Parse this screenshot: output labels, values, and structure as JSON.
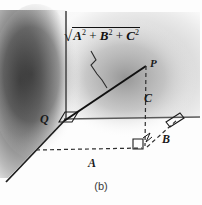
{
  "figure": {
    "caption": "(b)",
    "formula": {
      "radical": "√",
      "term1": "A",
      "exp1": "2",
      "plus1": "+",
      "term2": "B",
      "exp2": "2",
      "plus2": "+",
      "term3": "C",
      "exp3": "2",
      "full_text": "√(A² + B² + C²)"
    },
    "labels": {
      "P": "P",
      "Q": "Q",
      "A": "A",
      "B": "B",
      "C": "C"
    },
    "colors": {
      "ink": "#1a1a1a",
      "axis": "#555555",
      "dashed": "#3a3a3a",
      "shade_dark": "#4a4a4a",
      "shade_mid": "#b9b9b9",
      "paper": "#fdfdfd"
    },
    "elements": {
      "vertical_axis": "vertical-axis",
      "horizontal_axis": "horizontal-axis",
      "depth_axis": "depth-axis",
      "hypotenuse": "segment-QP",
      "leader_line": "zigzag-leader",
      "right_angle_origin": "right-angle-at-Q",
      "right_angle_base": "right-angle-at-base",
      "right_angle_axis": "right-angle-at-axis"
    }
  }
}
